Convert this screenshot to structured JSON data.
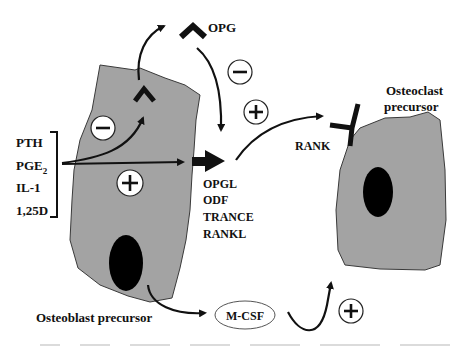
{
  "diagram": {
    "signals": [
      "PTH",
      "PGE",
      "IL-1",
      "1,25D"
    ],
    "pge_subscript": "2",
    "ligand_names": [
      "OPGL",
      "ODF",
      "TRANCE",
      "RANKL"
    ],
    "opg_label": "OPG",
    "rank_label": "RANK",
    "mcsf_label": "M-CSF",
    "osteoblast_label": "Osteoblast precursor",
    "osteoclast_label_line1": "Osteoclast",
    "osteoclast_label_line2": "precursor",
    "signs": {
      "inhibit_cell": "minus",
      "stimulate_cell": "plus",
      "opg_inhibit": "minus",
      "rankl_stimulate": "plus",
      "mcsf_stimulate": "plus"
    },
    "cell_color": "#a3a3a3"
  }
}
